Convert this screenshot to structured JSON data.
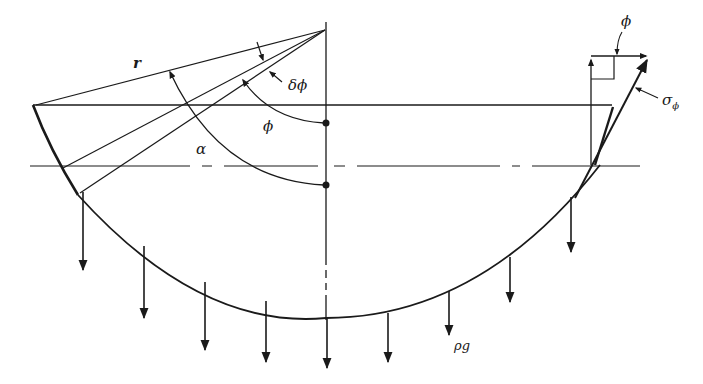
{
  "diagram": {
    "labels": {
      "radius": "r",
      "delta_phi": "δϕ",
      "phi_inner": "ϕ",
      "alpha": "α",
      "phi_top": "ϕ",
      "sigma_phi": "σ",
      "sigma_sub": "ϕ",
      "load": "ρg"
    },
    "colors": {
      "ink": "#1a1a1a",
      "background": "#ffffff"
    },
    "load_arrows": [
      {
        "x": 83,
        "y0": 192,
        "y1": 270
      },
      {
        "x": 144,
        "y0": 246,
        "y1": 317
      },
      {
        "x": 205,
        "y0": 282,
        "y1": 348
      },
      {
        "x": 266,
        "y0": 301,
        "y1": 361
      },
      {
        "x": 327,
        "y0": 318,
        "y1": 368
      },
      {
        "x": 388,
        "y0": 313,
        "y1": 361
      },
      {
        "x": 449,
        "y0": 291,
        "y1": 335
      },
      {
        "x": 510,
        "y0": 257,
        "y1": 302
      },
      {
        "x": 571,
        "y0": 197,
        "y1": 251
      }
    ]
  }
}
